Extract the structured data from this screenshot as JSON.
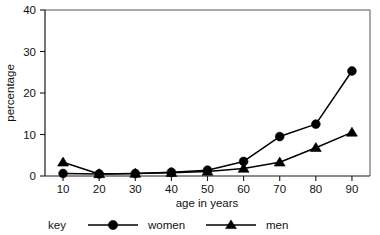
{
  "chart_data": {
    "type": "line",
    "title": "",
    "subtitle": "",
    "xlabel": "age in years",
    "ylabel": "percentage",
    "x": [
      10,
      20,
      30,
      40,
      50,
      60,
      70,
      80,
      90
    ],
    "xticklabels": [
      "10",
      "20",
      "30",
      "40",
      "50",
      "60",
      "70",
      "80",
      "90"
    ],
    "yticklabels": [
      "0",
      "10",
      "20",
      "30",
      "40"
    ],
    "yticks": [
      0,
      10,
      20,
      30,
      40
    ],
    "xlim": [
      5,
      95
    ],
    "ylim": [
      0,
      40
    ],
    "grid": false,
    "legend_position": "bottom",
    "legend_title": "key",
    "series": [
      {
        "name": "women",
        "marker": "circle",
        "color": "#000000",
        "values": [
          0.6,
          0.5,
          0.6,
          0.9,
          1.4,
          3.5,
          9.5,
          12.5,
          25.3
        ]
      },
      {
        "name": "men",
        "marker": "triangle",
        "color": "#000000",
        "values": [
          3.3,
          0.5,
          0.6,
          0.8,
          1.1,
          1.8,
          3.3,
          6.8,
          10.5
        ]
      }
    ]
  },
  "legend": {
    "key_label": "key",
    "entries": [
      {
        "label": "women",
        "marker": "circle-marker"
      },
      {
        "label": "men",
        "marker": "triangle-marker"
      }
    ]
  },
  "colors": {
    "ink": "#000000",
    "frame": "#555555",
    "background": "#ffffff"
  }
}
